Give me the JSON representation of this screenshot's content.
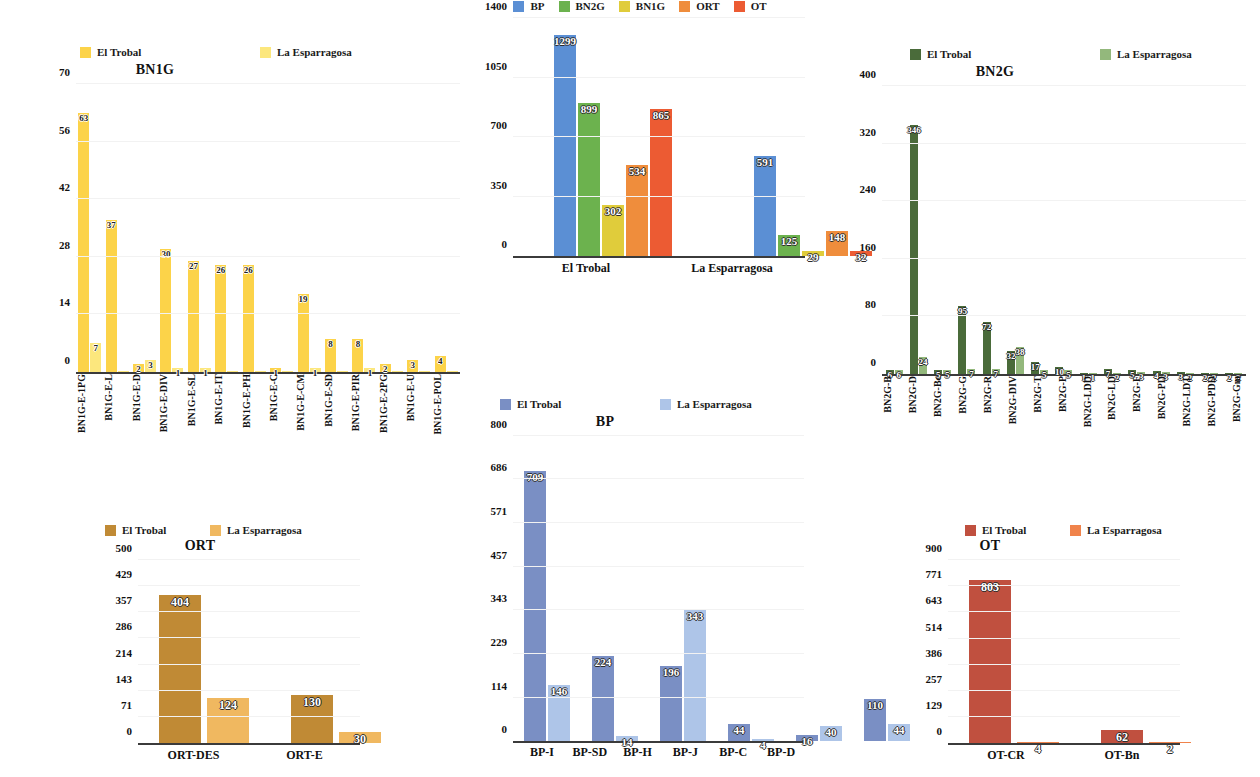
{
  "common": {
    "legend_el_trobal": "El Trobal",
    "legend_la_esparragosa": "La Esparragosa"
  },
  "chart_data": [
    {
      "id": "bn1g",
      "type": "bar",
      "title": "BN1G",
      "xlabel": "",
      "ylabel": "",
      "ylim": [
        0,
        70
      ],
      "yticks": [
        0,
        14,
        28,
        42,
        56,
        70
      ],
      "grid": true,
      "legend_position": "top",
      "colors": {
        "El Trobal": "#FCD349",
        "La Esparragosa": "#FCE77D"
      },
      "categories": [
        "BN1G-E-1PG",
        "BN1G-E-L",
        "BN1G-E-D",
        "BN1G-E-DIV",
        "BN1G-E-SL",
        "BN1G-E-IT",
        "BN1G-E-PH",
        "BN1G-E-C",
        "BN1G-E-CM",
        "BN1G-E-SD",
        "BN1G-E-PIR",
        "BN1G-E-2PG",
        "BN1G-E-U",
        "BN1G-E-POL"
      ],
      "series": [
        {
          "name": "El Trobal",
          "values": [
            63,
            37,
            2,
            30,
            27,
            26,
            26,
            1,
            19,
            8,
            8,
            2,
            3,
            4
          ]
        },
        {
          "name": "La Esparragosa",
          "values": [
            7,
            0,
            3,
            1,
            1,
            0,
            0,
            0,
            1,
            0,
            1,
            0,
            0,
            0
          ]
        }
      ]
    },
    {
      "id": "overview",
      "type": "bar",
      "title": "",
      "xlabel": "",
      "ylabel": "",
      "ylim": [
        0,
        1400
      ],
      "yticks": [
        0,
        350,
        700,
        1050,
        1400
      ],
      "grid": true,
      "legend_position": "top",
      "legend_entries": [
        "BP",
        "BN2G",
        "BN1G",
        "ORT",
        "OT"
      ],
      "colors": {
        "BP": "#5B8FD4",
        "BN2G": "#6CB24E",
        "BN1G": "#E0CC3B",
        "ORT": "#EF8D3C",
        "OT": "#EC5B33"
      },
      "categories": [
        "El Trobal",
        "La Esparragosa"
      ],
      "series": [
        {
          "name": "BP",
          "values": [
            1299,
            591
          ]
        },
        {
          "name": "BN2G",
          "values": [
            899,
            125
          ]
        },
        {
          "name": "BN1G",
          "values": [
            302,
            29
          ]
        },
        {
          "name": "ORT",
          "values": [
            534,
            148
          ]
        },
        {
          "name": "OT",
          "values": [
            865,
            32
          ]
        }
      ]
    },
    {
      "id": "bn2g",
      "type": "bar",
      "title": "BN2G",
      "xlabel": "",
      "ylabel": "",
      "ylim": [
        0,
        400
      ],
      "yticks": [
        0,
        80,
        160,
        240,
        320,
        400
      ],
      "grid": true,
      "legend_position": "top",
      "colors": {
        "El Trobal": "#4A6B3A",
        "La Esparragosa": "#93B87C"
      },
      "categories": [
        "BN2G-B",
        "BN2G-D",
        "BN2G-Bc",
        "BN2G-G",
        "BN2G-R",
        "BN2G-DIV",
        "BN2G-T",
        "BN2G-P",
        "BN2G-LDD",
        "BN2G-LD",
        "BN2G-F",
        "BN2G-PD",
        "BN2G-LDT",
        "BN2G-PDD",
        "BN2G-Gm"
      ],
      "series": [
        {
          "name": "El Trobal",
          "values": [
            6,
            346,
            5,
            95,
            72,
            32,
            17,
            10,
            1,
            7,
            5,
            4,
            3,
            2,
            2
          ]
        },
        {
          "name": "La Esparragosa",
          "values": [
            6,
            24,
            5,
            7,
            7,
            38,
            5,
            5,
            1,
            2,
            3,
            3,
            2,
            2,
            2
          ]
        }
      ]
    },
    {
      "id": "ort",
      "type": "bar",
      "title": "ORT",
      "xlabel": "",
      "ylabel": "",
      "ylim": [
        0,
        500
      ],
      "yticks": [
        0,
        71,
        143,
        214,
        286,
        357,
        429,
        500
      ],
      "grid": true,
      "legend_position": "top",
      "colors": {
        "El Trobal": "#C08A35",
        "La Esparragosa": "#F0B860"
      },
      "categories": [
        "ORT-DES",
        "ORT-E"
      ],
      "series": [
        {
          "name": "El Trobal",
          "values": [
            404,
            130
          ]
        },
        {
          "name": "La Esparragosa",
          "values": [
            124,
            30
          ]
        }
      ]
    },
    {
      "id": "bp",
      "type": "bar",
      "title": "BP",
      "xlabel": "",
      "ylabel": "",
      "ylim": [
        0,
        800
      ],
      "yticks": [
        0,
        114,
        229,
        343,
        457,
        571,
        686,
        800
      ],
      "grid": true,
      "legend_position": "top",
      "colors": {
        "El Trobal": "#7A8FC4",
        "La Esparragosa": "#AEC5E8"
      },
      "categories": [
        "BP-I",
        "BP-SD",
        "BP-H",
        "BP-J",
        "BP-C",
        "BP-D"
      ],
      "series": [
        {
          "name": "El Trobal",
          "values": [
            709,
            224,
            196,
            44,
            16,
            110
          ]
        },
        {
          "name": "La Esparragosa",
          "values": [
            146,
            14,
            343,
            4,
            40,
            44
          ]
        }
      ]
    },
    {
      "id": "ot",
      "type": "bar",
      "title": "OT",
      "xlabel": "",
      "ylabel": "",
      "ylim": [
        0,
        900
      ],
      "yticks": [
        0,
        129,
        257,
        386,
        514,
        643,
        771,
        900
      ],
      "grid": true,
      "legend_position": "top",
      "colors": {
        "El Trobal": "#C0503F",
        "La Esparragosa": "#F0834B"
      },
      "categories": [
        "OT-CR",
        "OT-Bn"
      ],
      "series": [
        {
          "name": "El Trobal",
          "values": [
            803,
            62
          ]
        },
        {
          "name": "La Esparragosa",
          "values": [
            4,
            2
          ]
        }
      ]
    }
  ]
}
